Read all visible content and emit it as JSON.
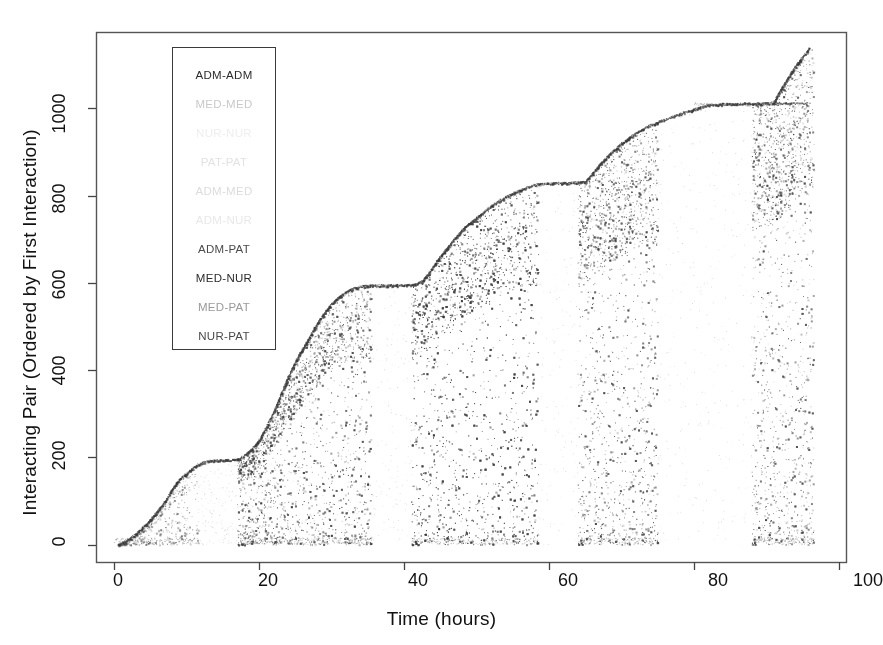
{
  "figure": {
    "width": 883,
    "height": 645,
    "background": "#ffffff"
  },
  "axes": {
    "xlabel": "Time (hours)",
    "ylabel": "Interacting Pair (Ordered by First Interaction)",
    "x_ticks": [
      "0",
      "20",
      "40",
      "60",
      "80",
      "100"
    ],
    "y_ticks": [
      "0",
      "200",
      "400",
      "600",
      "800",
      "1000"
    ]
  },
  "legend": {
    "entries": [
      {
        "label": "ADM-ADM",
        "color": "#2b2b2b"
      },
      {
        "label": "MED-MED",
        "color": "#c9c9c9"
      },
      {
        "label": "NUR-NUR",
        "color": "#eeeeee"
      },
      {
        "label": "PAT-PAT",
        "color": "#e2e2e2"
      },
      {
        "label": "ADM-MED",
        "color": "#dcdcdc"
      },
      {
        "label": "ADM-NUR",
        "color": "#e8e8e8"
      },
      {
        "label": "ADM-PAT",
        "color": "#4a4a4a"
      },
      {
        "label": "MED-NUR",
        "color": "#2b2b2b"
      },
      {
        "label": "MED-PAT",
        "color": "#9a9a9a"
      },
      {
        "label": "NUR-PAT",
        "color": "#4a4a4a"
      }
    ]
  },
  "chart_data": {
    "type": "scatter",
    "title": "",
    "xlabel": "Time (hours)",
    "ylabel": "Interacting Pair (Ordered by First Interaction)",
    "xlim": [
      -2.5,
      101
    ],
    "ylim": [
      -40,
      1175
    ],
    "grid": false,
    "legend_position": "upper-left-inset",
    "point_color": "#3a3a3a",
    "point_size": 1.4,
    "frontier": {
      "name": "first-interaction-envelope",
      "x": [
        0.5,
        1.5,
        3,
        4.5,
        6,
        7,
        8,
        9,
        11,
        12,
        13,
        16,
        17,
        18,
        19,
        20,
        21,
        22,
        23,
        24,
        25,
        26,
        27,
        28,
        29,
        30,
        31,
        32,
        33,
        34,
        35,
        40,
        41.5,
        42.5,
        43.5,
        44.5,
        45.5,
        46.5,
        47.5,
        48.5,
        50,
        51.5,
        53,
        55,
        57,
        58,
        60,
        63,
        65,
        66,
        67,
        68,
        69,
        70,
        71,
        72,
        73,
        74,
        76,
        78,
        80,
        82,
        84,
        88,
        90,
        91,
        91.5,
        92.5,
        93.5,
        94.5,
        95.5,
        96
      ],
      "y": [
        0,
        8,
        25,
        48,
        78,
        100,
        128,
        150,
        178,
        188,
        192,
        194,
        196,
        205,
        220,
        240,
        270,
        305,
        345,
        385,
        420,
        450,
        478,
        508,
        532,
        552,
        568,
        580,
        588,
        592,
        594,
        595,
        596,
        605,
        625,
        650,
        672,
        692,
        712,
        730,
        750,
        770,
        788,
        806,
        820,
        826,
        828,
        830,
        832,
        852,
        872,
        890,
        905,
        920,
        932,
        944,
        954,
        962,
        975,
        988,
        998,
        1008,
        1010,
        1011,
        1012,
        1014,
        1030,
        1058,
        1085,
        1108,
        1128,
        1140
      ]
    },
    "activity_bands": [
      {
        "x_start": 0.0,
        "x_end": 11.5,
        "y_low": 0,
        "y_high": 195,
        "density": 0.55
      },
      {
        "x_start": 17.0,
        "x_end": 35.5,
        "y_low": 0,
        "y_high": 596,
        "density": 0.85
      },
      {
        "x_start": 41.0,
        "x_end": 58.5,
        "y_low": 0,
        "y_high": 828,
        "density": 0.8
      },
      {
        "x_start": 64.0,
        "x_end": 75.0,
        "y_low": 0,
        "y_high": 955,
        "density": 0.7
      },
      {
        "x_start": 88.0,
        "x_end": 96.5,
        "y_low": 0,
        "y_high": 1140,
        "density": 0.65
      }
    ],
    "quiet_gaps": [
      {
        "x_start": 11.5,
        "x_end": 17.0
      },
      {
        "x_start": 35.5,
        "x_end": 41.0
      },
      {
        "x_start": 58.5,
        "x_end": 64.0
      },
      {
        "x_start": 75.0,
        "x_end": 88.0
      }
    ],
    "n_pairs_total": 1140,
    "duration_hours": 96
  }
}
